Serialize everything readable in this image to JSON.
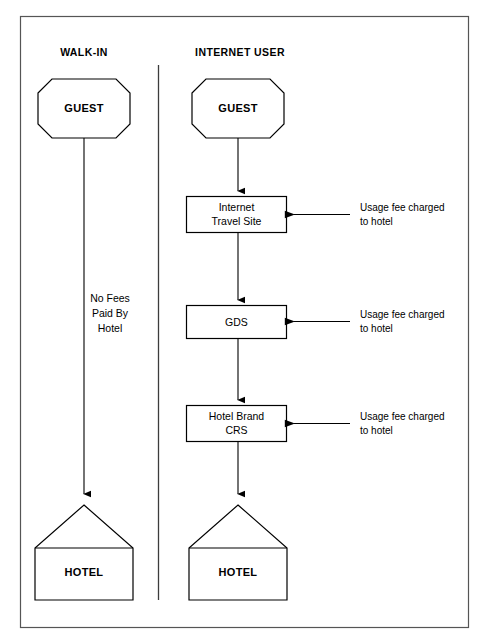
{
  "diagram": {
    "columns": [
      {
        "id": "walk-in",
        "header": "WALK-IN"
      },
      {
        "id": "internet-user",
        "header": "INTERNET USER"
      }
    ],
    "walk_in": {
      "start_node": "GUEST",
      "end_node": "HOTEL",
      "note_lines": [
        "No Fees",
        "Paid By",
        "Hotel"
      ],
      "note_text": "No Fees Paid By Hotel"
    },
    "internet_user": {
      "start_node": "GUEST",
      "end_node": "HOTEL",
      "steps": [
        {
          "id": "internet-travel-site",
          "lines": [
            "Internet",
            "Travel Site"
          ],
          "text": "Internet Travel Site",
          "annotation_lines": [
            "Usage fee charged",
            "to hotel"
          ],
          "annotation_text": "Usage fee charged to hotel"
        },
        {
          "id": "gds",
          "lines": [
            "GDS"
          ],
          "text": "GDS",
          "annotation_lines": [
            "Usage fee charged",
            "to hotel"
          ],
          "annotation_text": "Usage fee charged to hotel"
        },
        {
          "id": "hotel-brand-crs",
          "lines": [
            "Hotel Brand",
            "CRS"
          ],
          "text": "Hotel Brand CRS",
          "annotation_lines": [
            "Usage fee charged",
            "to hotel"
          ],
          "annotation_text": "Usage fee charged to hotel"
        }
      ]
    },
    "colors": {
      "background": "#ffffff",
      "stroke": "#000000",
      "frame": "#555555",
      "divider": "#3c3c3c",
      "text": "#000000"
    }
  }
}
